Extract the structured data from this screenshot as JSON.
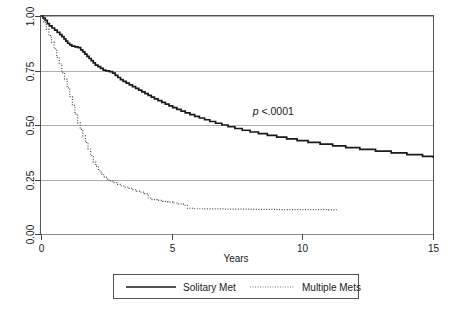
{
  "chart_data": {
    "type": "line",
    "title": "",
    "subtitle": "",
    "xlabel": "Years",
    "ylabel": "",
    "xlim": [
      0,
      15
    ],
    "ylim": [
      0,
      1.0
    ],
    "xticks": [
      0,
      5,
      10,
      15
    ],
    "xtick_labels": [
      "0",
      "5",
      "10",
      "15"
    ],
    "yticks": [
      0.0,
      0.25,
      0.5,
      0.75,
      1.0
    ],
    "ytick_labels": [
      "0.00",
      "0.25",
      "0.50",
      "0.75",
      "1.00"
    ],
    "grid": true,
    "grid_axis": "y",
    "legend_position": "below",
    "annotations": [
      {
        "name": "p-value",
        "text_italic": "p",
        "text_rest": " <.0001",
        "x": 8.1,
        "y": 0.545
      }
    ],
    "series": [
      {
        "name": "Solitary Met",
        "style": "solid",
        "color": "#1a1a1a",
        "points": [
          [
            0.0,
            1.0
          ],
          [
            0.1,
            0.995
          ],
          [
            0.18,
            0.988
          ],
          [
            0.26,
            0.98
          ],
          [
            0.34,
            0.972
          ],
          [
            0.42,
            0.963
          ],
          [
            0.52,
            0.955
          ],
          [
            0.62,
            0.946
          ],
          [
            0.72,
            0.936
          ],
          [
            0.82,
            0.928
          ],
          [
            0.92,
            0.918
          ],
          [
            1.02,
            0.908
          ],
          [
            1.12,
            0.898
          ],
          [
            1.2,
            0.888
          ],
          [
            1.28,
            0.878
          ],
          [
            1.36,
            0.872
          ],
          [
            1.44,
            0.866
          ],
          [
            1.56,
            0.86
          ],
          [
            1.66,
            0.852
          ],
          [
            1.74,
            0.843
          ],
          [
            1.82,
            0.833
          ],
          [
            1.9,
            0.823
          ],
          [
            1.98,
            0.812
          ],
          [
            2.06,
            0.8
          ],
          [
            2.14,
            0.79
          ],
          [
            2.22,
            0.78
          ],
          [
            2.3,
            0.768
          ],
          [
            2.38,
            0.757
          ],
          [
            2.46,
            0.753
          ],
          [
            2.58,
            0.75
          ],
          [
            2.7,
            0.748
          ],
          [
            2.8,
            0.74
          ],
          [
            2.9,
            0.73
          ],
          [
            3.0,
            0.72
          ],
          [
            3.1,
            0.712
          ],
          [
            3.2,
            0.704
          ],
          [
            3.3,
            0.696
          ],
          [
            3.42,
            0.688
          ],
          [
            3.52,
            0.68
          ],
          [
            3.62,
            0.672
          ],
          [
            3.72,
            0.664
          ],
          [
            3.84,
            0.657
          ],
          [
            3.96,
            0.65
          ],
          [
            4.06,
            0.643
          ],
          [
            4.18,
            0.637
          ],
          [
            4.3,
            0.63
          ],
          [
            4.42,
            0.622
          ],
          [
            4.54,
            0.614
          ],
          [
            4.66,
            0.606
          ],
          [
            4.78,
            0.598
          ],
          [
            4.9,
            0.59
          ],
          [
            5.0,
            0.584
          ],
          [
            5.12,
            0.578
          ],
          [
            5.24,
            0.572
          ],
          [
            5.36,
            0.566
          ],
          [
            5.48,
            0.56
          ],
          [
            5.6,
            0.552
          ],
          [
            5.74,
            0.546
          ],
          [
            5.86,
            0.54
          ],
          [
            6.0,
            0.532
          ],
          [
            6.14,
            0.524
          ],
          [
            6.28,
            0.518
          ],
          [
            6.42,
            0.51
          ],
          [
            6.56,
            0.504
          ],
          [
            6.7,
            0.498
          ],
          [
            6.84,
            0.492
          ],
          [
            7.0,
            0.486
          ],
          [
            7.16,
            0.48
          ],
          [
            7.32,
            0.473
          ],
          [
            7.48,
            0.466
          ],
          [
            7.64,
            0.46
          ],
          [
            7.8,
            0.452
          ],
          [
            7.96,
            0.446
          ],
          [
            8.14,
            0.44
          ],
          [
            8.32,
            0.434
          ],
          [
            8.5,
            0.428
          ],
          [
            8.7,
            0.421
          ],
          [
            8.9,
            0.414
          ],
          [
            9.12,
            0.408
          ],
          [
            9.34,
            0.4
          ],
          [
            9.6,
            0.394
          ],
          [
            9.86,
            0.388
          ],
          [
            10.1,
            0.382
          ],
          [
            10.4,
            0.377
          ],
          [
            10.7,
            0.371
          ],
          [
            11.0,
            0.366
          ],
          [
            11.4,
            0.36
          ],
          [
            11.8,
            0.354
          ],
          [
            12.2,
            0.35
          ],
          [
            12.7,
            0.346
          ],
          [
            13.2,
            0.342
          ],
          [
            13.8,
            0.338
          ],
          [
            14.4,
            0.334
          ],
          [
            15.0,
            0.33
          ]
        ]
      },
      {
        "name": "Multiple Mets",
        "style": "dotted",
        "color": "#4a4a4a",
        "points": []
      }
    ],
    "km_curves": {
      "solitary_met": {
        "label": "Solitary Met",
        "line_style": "solid",
        "steps": [
          [
            0.0,
            1.0
          ],
          [
            0.08,
            0.99
          ],
          [
            0.16,
            0.98
          ],
          [
            0.24,
            0.965
          ],
          [
            0.32,
            0.955
          ],
          [
            0.42,
            0.945
          ],
          [
            0.52,
            0.935
          ],
          [
            0.62,
            0.925
          ],
          [
            0.72,
            0.915
          ],
          [
            0.8,
            0.905
          ],
          [
            0.88,
            0.895
          ],
          [
            0.95,
            0.885
          ],
          [
            1.02,
            0.875
          ],
          [
            1.1,
            0.868
          ],
          [
            1.18,
            0.862
          ],
          [
            1.3,
            0.858
          ],
          [
            1.42,
            0.855
          ],
          [
            1.52,
            0.845
          ],
          [
            1.6,
            0.835
          ],
          [
            1.68,
            0.825
          ],
          [
            1.76,
            0.815
          ],
          [
            1.84,
            0.805
          ],
          [
            1.92,
            0.795
          ],
          [
            2.0,
            0.785
          ],
          [
            2.08,
            0.775
          ],
          [
            2.18,
            0.768
          ],
          [
            2.28,
            0.76
          ],
          [
            2.38,
            0.752
          ],
          [
            2.48,
            0.748
          ],
          [
            2.62,
            0.745
          ],
          [
            2.74,
            0.738
          ],
          [
            2.84,
            0.728
          ],
          [
            2.94,
            0.718
          ],
          [
            3.04,
            0.708
          ],
          [
            3.14,
            0.7
          ],
          [
            3.26,
            0.692
          ],
          [
            3.38,
            0.684
          ],
          [
            3.5,
            0.676
          ],
          [
            3.62,
            0.668
          ],
          [
            3.74,
            0.66
          ],
          [
            3.86,
            0.652
          ],
          [
            3.98,
            0.644
          ],
          [
            4.1,
            0.636
          ],
          [
            4.22,
            0.628
          ],
          [
            4.34,
            0.62
          ],
          [
            4.48,
            0.612
          ],
          [
            4.62,
            0.604
          ],
          [
            4.76,
            0.596
          ],
          [
            4.9,
            0.588
          ],
          [
            5.04,
            0.58
          ],
          [
            5.2,
            0.572
          ],
          [
            5.36,
            0.564
          ],
          [
            5.52,
            0.556
          ],
          [
            5.7,
            0.548
          ],
          [
            5.88,
            0.54
          ],
          [
            6.06,
            0.532
          ],
          [
            6.26,
            0.524
          ],
          [
            6.46,
            0.516
          ],
          [
            6.68,
            0.508
          ],
          [
            6.92,
            0.5
          ],
          [
            7.16,
            0.492
          ],
          [
            7.42,
            0.484
          ],
          [
            7.7,
            0.476
          ],
          [
            8.0,
            0.468
          ],
          [
            8.32,
            0.46
          ],
          [
            8.66,
            0.452
          ],
          [
            9.02,
            0.444
          ],
          [
            9.4,
            0.436
          ],
          [
            9.8,
            0.428
          ],
          [
            10.22,
            0.42
          ],
          [
            10.68,
            0.412
          ],
          [
            11.16,
            0.404
          ],
          [
            11.66,
            0.396
          ],
          [
            12.2,
            0.388
          ],
          [
            12.8,
            0.38
          ],
          [
            13.4,
            0.372
          ],
          [
            14.0,
            0.364
          ],
          [
            14.6,
            0.356
          ],
          [
            15.0,
            0.35
          ]
        ]
      },
      "multiple_mets": {
        "label": "Multiple Mets",
        "line_style": "dotted",
        "steps": [
          [
            0.0,
            1.0
          ],
          [
            0.1,
            0.97
          ],
          [
            0.2,
            0.94
          ],
          [
            0.3,
            0.91
          ],
          [
            0.4,
            0.88
          ],
          [
            0.5,
            0.85
          ],
          [
            0.6,
            0.81
          ],
          [
            0.7,
            0.78
          ],
          [
            0.8,
            0.74
          ],
          [
            0.9,
            0.71
          ],
          [
            1.0,
            0.67
          ],
          [
            1.1,
            0.63
          ],
          [
            1.2,
            0.59
          ],
          [
            1.3,
            0.55
          ],
          [
            1.4,
            0.51
          ],
          [
            1.5,
            0.48
          ],
          [
            1.6,
            0.45
          ],
          [
            1.7,
            0.42
          ],
          [
            1.8,
            0.39
          ],
          [
            1.9,
            0.36
          ],
          [
            2.0,
            0.33
          ],
          [
            2.1,
            0.31
          ],
          [
            2.2,
            0.29
          ],
          [
            2.3,
            0.275
          ],
          [
            2.4,
            0.262
          ],
          [
            2.5,
            0.252
          ],
          [
            2.6,
            0.244
          ],
          [
            2.75,
            0.236
          ],
          [
            2.9,
            0.228
          ],
          [
            3.05,
            0.221
          ],
          [
            3.2,
            0.215
          ],
          [
            3.35,
            0.209
          ],
          [
            3.5,
            0.203
          ],
          [
            3.65,
            0.197
          ],
          [
            3.8,
            0.192
          ],
          [
            3.95,
            0.185
          ],
          [
            4.1,
            0.165
          ],
          [
            4.25,
            0.158
          ],
          [
            4.45,
            0.154
          ],
          [
            4.65,
            0.15
          ],
          [
            4.85,
            0.146
          ],
          [
            5.05,
            0.142
          ],
          [
            5.25,
            0.138
          ],
          [
            5.45,
            0.132
          ],
          [
            5.6,
            0.118
          ],
          [
            5.8,
            0.116
          ],
          [
            6.2,
            0.115
          ],
          [
            7.0,
            0.114
          ],
          [
            8.0,
            0.113
          ],
          [
            9.0,
            0.112
          ],
          [
            10.0,
            0.112
          ],
          [
            11.0,
            0.111
          ],
          [
            11.3,
            0.11
          ]
        ]
      }
    }
  },
  "axes": {
    "x_title": "Years",
    "x_tick_labels": [
      "0",
      "5",
      "10",
      "15"
    ],
    "y_tick_labels": [
      "0.00",
      "0.25",
      "0.50",
      "0.75",
      "1.00"
    ]
  },
  "legend": {
    "items": [
      {
        "label": "Solitary Met",
        "style": "solid"
      },
      {
        "label": "Multiple Mets",
        "style": "dotted"
      }
    ]
  },
  "annotation": {
    "p_symbol": "p",
    "p_value_text": " <.0001"
  }
}
